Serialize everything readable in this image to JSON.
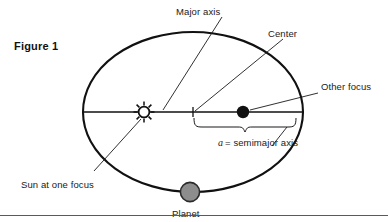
{
  "figure": {
    "caption_label": "Figure 1"
  },
  "labels": {
    "major_axis": "Major axis",
    "center": "Center",
    "other_focus": "Other focus",
    "sun_at_one_focus": "Sun at one focus",
    "planet": "Planet",
    "semimajor_symbol": "a",
    "semimajor_text": "= semimajor  axis"
  },
  "icons": {
    "sun": "sun-icon",
    "other_focus_dot": "filled-dot-icon",
    "planet_dot": "gray-circle-icon",
    "center_tick": "tick-mark-icon",
    "brace": "curly-brace-icon"
  },
  "colors": {
    "background": "#ffffff",
    "stroke": "#111111",
    "text": "#1a1a1a",
    "planet_fill": "#8d8d8d",
    "planet_stroke": "#2b2b2b",
    "focus_fill": "#111111",
    "sun_fill": "#ffffff",
    "rule": "#5a5a5a"
  },
  "geometry": {
    "ellipse_center_x": 193,
    "ellipse_center_y": 112,
    "ellipse_rx": 110,
    "ellipse_ry": 80,
    "sun_focus_x": 144,
    "other_focus_x": 243,
    "major_axis_y": 112,
    "planet_x": 190,
    "planet_y": 192
  }
}
